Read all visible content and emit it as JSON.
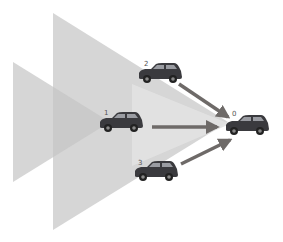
{
  "diagram": {
    "colors": {
      "background": "#ffffff",
      "cone_fill": "#c8c8c8",
      "cone_light_fill": "#dcdcdc",
      "arrow": "#6e6a68",
      "car_body": "#3a3a3e",
      "label": "#555555"
    },
    "cars": [
      {
        "id": "0",
        "label": "0",
        "x": 247,
        "y": 126
      },
      {
        "id": "1",
        "label": "1",
        "x": 121,
        "y": 123
      },
      {
        "id": "2",
        "label": "2",
        "x": 160,
        "y": 74
      },
      {
        "id": "3",
        "label": "3",
        "x": 156,
        "y": 172
      }
    ],
    "arrows": [
      {
        "from": "2",
        "to": "0"
      },
      {
        "from": "1",
        "to": "0"
      },
      {
        "from": "3",
        "to": "0"
      }
    ],
    "cones": [
      {
        "name": "cone-outer",
        "points": "53,13 53,230 228,122"
      },
      {
        "name": "cone-left",
        "points": "13,62 13,182 110,122"
      },
      {
        "name": "cone-center",
        "points": "132,84 132,166 230,124"
      }
    ]
  }
}
